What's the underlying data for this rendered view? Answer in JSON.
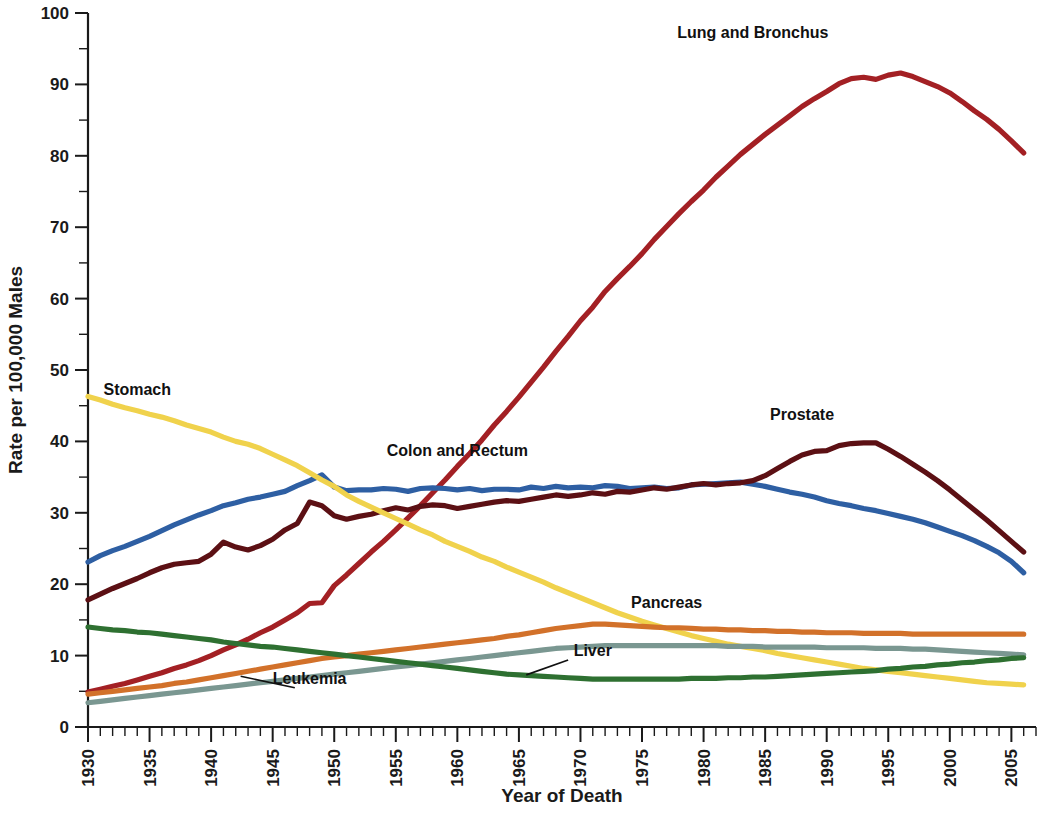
{
  "chart_data": {
    "type": "line",
    "title": "",
    "xlabel": "Year of Death",
    "ylabel": "Rate per 100,000 Males",
    "xlim": [
      1930,
      2007
    ],
    "ylim": [
      0,
      100
    ],
    "grid": false,
    "legend_position": "inline-annotations",
    "x_tick_labels": [
      "1930",
      "1935",
      "1940",
      "1945",
      "1950",
      "1955",
      "1960",
      "1965",
      "1970",
      "1975",
      "1980",
      "1985",
      "1990",
      "1995",
      "2000",
      "2005"
    ],
    "x_tick_values": [
      1930,
      1935,
      1940,
      1945,
      1950,
      1955,
      1960,
      1965,
      1970,
      1975,
      1980,
      1985,
      1990,
      1995,
      2000,
      2005
    ],
    "x_minor_step": 1,
    "y_tick_labels": [
      "0",
      "10",
      "20",
      "30",
      "40",
      "50",
      "60",
      "70",
      "80",
      "90",
      "100"
    ],
    "y_tick_values": [
      0,
      10,
      20,
      30,
      40,
      50,
      60,
      70,
      80,
      90,
      100
    ],
    "y_minor_step": 5,
    "x": [
      1930,
      1931,
      1932,
      1933,
      1934,
      1935,
      1936,
      1937,
      1938,
      1939,
      1940,
      1941,
      1942,
      1943,
      1944,
      1945,
      1946,
      1947,
      1948,
      1949,
      1950,
      1951,
      1952,
      1953,
      1954,
      1955,
      1956,
      1957,
      1958,
      1959,
      1960,
      1961,
      1962,
      1963,
      1964,
      1965,
      1966,
      1967,
      1968,
      1969,
      1970,
      1971,
      1972,
      1973,
      1974,
      1975,
      1976,
      1977,
      1978,
      1979,
      1980,
      1981,
      1982,
      1983,
      1984,
      1985,
      1986,
      1987,
      1988,
      1989,
      1990,
      1991,
      1992,
      1993,
      1994,
      1995,
      1996,
      1997,
      1998,
      1999,
      2000,
      2001,
      2002,
      2003,
      2004,
      2005,
      2006
    ],
    "series": [
      {
        "name": "Lung and Bronchus",
        "color": "#A32024",
        "label_x": 1984,
        "label_y": 96.5,
        "values": [
          4.9,
          5.3,
          5.7,
          6.1,
          6.6,
          7.1,
          7.6,
          8.2,
          8.7,
          9.3,
          10.0,
          10.8,
          11.5,
          12.3,
          13.2,
          14.0,
          15.0,
          16.0,
          17.3,
          17.4,
          19.8,
          21.3,
          22.9,
          24.5,
          26.0,
          27.6,
          29.3,
          31.0,
          32.8,
          34.6,
          36.5,
          38.3,
          40.2,
          42.3,
          44.2,
          46.2,
          48.3,
          50.4,
          52.6,
          54.7,
          56.9,
          58.8,
          61.0,
          62.8,
          64.5,
          66.3,
          68.3,
          70.1,
          71.9,
          73.6,
          75.2,
          77.0,
          78.6,
          80.2,
          81.6,
          83.0,
          84.3,
          85.6,
          86.9,
          88.0,
          89.0,
          90.1,
          90.8,
          91.0,
          90.7,
          91.3,
          91.6,
          91.1,
          90.4,
          89.7,
          88.8,
          87.6,
          86.3,
          85.1,
          83.7,
          82.1,
          80.4
        ],
        "note": "Values after 1990 continue the decline: 1996 91.6 peak region, falling to 68.5 by 2006"
      },
      {
        "name": "Colon and Rectum",
        "color": "#2E5FA3",
        "label_x": 1960,
        "label_y": 38.0,
        "values": [
          23.1,
          24.0,
          24.7,
          25.3,
          26.0,
          26.7,
          27.5,
          28.3,
          29.0,
          29.7,
          30.3,
          31.0,
          31.4,
          31.9,
          32.2,
          32.6,
          33.0,
          33.8,
          34.5,
          35.3,
          33.6,
          33.1,
          33.2,
          33.2,
          33.4,
          33.3,
          33.0,
          33.4,
          33.5,
          33.4,
          33.2,
          33.4,
          33.1,
          33.3,
          33.3,
          33.2,
          33.6,
          33.4,
          33.7,
          33.5,
          33.6,
          33.5,
          33.8,
          33.7,
          33.4,
          33.5,
          33.6,
          33.4,
          33.5,
          33.9,
          34.0,
          34.1,
          34.2,
          34.3,
          34.0,
          33.7,
          33.3,
          32.9,
          32.6,
          32.2,
          31.7,
          31.3,
          31.0,
          30.6,
          30.3,
          29.9,
          29.5,
          29.1,
          28.6,
          28.0,
          27.4,
          26.8,
          26.1,
          25.3,
          24.4,
          23.2,
          21.6
        ],
        "note": "peak near 1947-1949 at ~35.5, plateau ~33-34 from 1950-1985, declining to 21.6 by 2006"
      },
      {
        "name": "Prostate",
        "color": "#5C1014",
        "label_x": 1988,
        "label_y": 43.0,
        "values": [
          17.8,
          18.6,
          19.4,
          20.1,
          20.8,
          21.6,
          22.3,
          22.8,
          23.0,
          23.2,
          24.2,
          25.9,
          25.2,
          24.8,
          25.4,
          26.3,
          27.6,
          28.5,
          31.5,
          31.0,
          29.6,
          29.1,
          29.5,
          29.8,
          30.3,
          30.7,
          30.4,
          30.9,
          31.1,
          31.0,
          30.6,
          30.9,
          31.2,
          31.5,
          31.7,
          31.6,
          31.9,
          32.2,
          32.5,
          32.3,
          32.5,
          32.8,
          32.6,
          33.0,
          32.9,
          33.2,
          33.5,
          33.3,
          33.6,
          33.9,
          34.1,
          33.9,
          34.1,
          34.2,
          34.5,
          35.2,
          36.2,
          37.2,
          38.1,
          38.6,
          38.7,
          39.4,
          39.7,
          39.8,
          39.8,
          38.9,
          37.9,
          36.8,
          35.7,
          34.5,
          33.2,
          31.8,
          30.4,
          29.0,
          27.5,
          26.0,
          24.5
        ],
        "note": "1941 local spike to ~25.9, 1948 spike ~31.5, peak ~39.8 at 1992-1994"
      },
      {
        "name": "Stomach",
        "color": "#F0D24C",
        "label_x": 1934,
        "label_y": 46.5,
        "values": [
          46.3,
          45.8,
          45.2,
          44.7,
          44.3,
          43.8,
          43.4,
          42.9,
          42.3,
          41.8,
          41.3,
          40.6,
          40.0,
          39.6,
          39.0,
          38.2,
          37.4,
          36.6,
          35.6,
          34.6,
          33.7,
          32.5,
          31.6,
          30.8,
          30.0,
          29.2,
          28.4,
          27.6,
          26.9,
          26.0,
          25.3,
          24.6,
          23.8,
          23.2,
          22.4,
          21.7,
          21.0,
          20.3,
          19.5,
          18.8,
          18.1,
          17.4,
          16.7,
          16.0,
          15.4,
          14.8,
          14.3,
          13.8,
          13.3,
          12.8,
          12.4,
          12.0,
          11.6,
          11.3,
          11.0,
          10.7,
          10.3,
          10.0,
          9.7,
          9.4,
          9.1,
          8.8,
          8.5,
          8.2,
          8.0,
          7.8,
          7.6,
          7.4,
          7.2,
          7.0,
          6.8,
          6.6,
          6.4,
          6.2,
          6.1,
          6.0,
          5.9
        ],
        "note": "steady monotonic decline from 46.3 in 1930 to 5.9 in 2006"
      },
      {
        "name": "Pancreas",
        "color": "#D2712A",
        "label_x": 1977,
        "label_y": 16.6,
        "values": [
          4.6,
          4.8,
          5.0,
          5.2,
          5.4,
          5.6,
          5.8,
          6.1,
          6.3,
          6.6,
          6.9,
          7.2,
          7.5,
          7.8,
          8.1,
          8.4,
          8.7,
          9.0,
          9.3,
          9.6,
          9.8,
          10.0,
          10.2,
          10.4,
          10.6,
          10.8,
          11.0,
          11.2,
          11.4,
          11.6,
          11.8,
          12.0,
          12.2,
          12.4,
          12.7,
          12.9,
          13.2,
          13.5,
          13.8,
          14.0,
          14.2,
          14.4,
          14.4,
          14.3,
          14.2,
          14.1,
          14.0,
          13.9,
          13.9,
          13.8,
          13.7,
          13.7,
          13.6,
          13.6,
          13.5,
          13.5,
          13.4,
          13.4,
          13.3,
          13.3,
          13.2,
          13.2,
          13.2,
          13.1,
          13.1,
          13.1,
          13.1,
          13.0,
          13.0,
          13.0,
          13.0,
          13.0,
          13.0,
          13.0,
          13.0,
          13.0,
          13.0
        ],
        "note": "rises to ~14.4 peak around 1970-72, then slight decline to ~13.0"
      },
      {
        "name": "Leukemia",
        "color": "#7A9791",
        "label_x": 1948,
        "label_y": 6.0,
        "values": [
          3.4,
          3.6,
          3.8,
          4.0,
          4.2,
          4.4,
          4.6,
          4.8,
          5.0,
          5.2,
          5.4,
          5.6,
          5.8,
          6.0,
          6.2,
          6.4,
          6.6,
          6.8,
          7.0,
          7.2,
          7.4,
          7.6,
          7.8,
          8.0,
          8.2,
          8.4,
          8.6,
          8.8,
          9.0,
          9.2,
          9.4,
          9.6,
          9.8,
          10.0,
          10.2,
          10.4,
          10.6,
          10.8,
          11.0,
          11.1,
          11.2,
          11.3,
          11.4,
          11.4,
          11.4,
          11.4,
          11.4,
          11.4,
          11.4,
          11.4,
          11.4,
          11.4,
          11.3,
          11.3,
          11.3,
          11.2,
          11.2,
          11.2,
          11.2,
          11.2,
          11.1,
          11.1,
          11.1,
          11.1,
          11.0,
          11.0,
          11.0,
          10.9,
          10.9,
          10.8,
          10.7,
          10.6,
          10.5,
          10.4,
          10.3,
          10.2,
          10.1
        ],
        "note": "rises from 3.4 to plateau ~11.4 around 1972-1981, slight decline to ~10.1"
      },
      {
        "name": "Liver",
        "color": "#2E7031",
        "label_x": 1971,
        "label_y": 10.0,
        "values": [
          14.0,
          13.8,
          13.6,
          13.5,
          13.3,
          13.2,
          13.0,
          12.8,
          12.6,
          12.4,
          12.2,
          11.9,
          11.7,
          11.5,
          11.3,
          11.2,
          11.0,
          10.8,
          10.6,
          10.4,
          10.2,
          10.0,
          9.8,
          9.6,
          9.4,
          9.2,
          9.0,
          8.8,
          8.6,
          8.4,
          8.2,
          8.0,
          7.8,
          7.6,
          7.4,
          7.3,
          7.2,
          7.1,
          7.0,
          6.9,
          6.8,
          6.7,
          6.7,
          6.7,
          6.7,
          6.7,
          6.7,
          6.7,
          6.7,
          6.8,
          6.8,
          6.8,
          6.9,
          6.9,
          7.0,
          7.0,
          7.1,
          7.2,
          7.3,
          7.4,
          7.5,
          7.6,
          7.7,
          7.8,
          7.9,
          8.1,
          8.2,
          8.4,
          8.5,
          8.7,
          8.8,
          9.0,
          9.1,
          9.3,
          9.4,
          9.6,
          9.7
        ],
        "note": "declines from 14.0 to a trough of ~6.7 around 1972-1978, then rises to ~9.7"
      }
    ],
    "annotations": [
      {
        "text": "Lung and Bronchus",
        "x": 1984,
        "y": 96.5,
        "leader": false
      },
      {
        "text": "Stomach",
        "x": 1934,
        "y": 46.5,
        "leader": false
      },
      {
        "text": "Colon and Rectum",
        "x": 1960,
        "y": 38.0,
        "leader": false
      },
      {
        "text": "Prostate",
        "x": 1988,
        "y": 43.0,
        "leader": false
      },
      {
        "text": "Pancreas",
        "x": 1977,
        "y": 16.6,
        "leader": false
      },
      {
        "text": "Liver",
        "x": 1971,
        "y": 10.0,
        "leader": true
      },
      {
        "text": "Leukemia",
        "x": 1948,
        "y": 6.0,
        "leader": true
      }
    ]
  },
  "axes": {
    "x_title": "Year of Death",
    "y_title": "Rate per 100,000 Males"
  }
}
